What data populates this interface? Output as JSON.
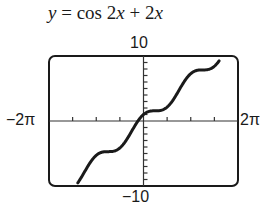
{
  "chart_data": {
    "type": "line",
    "title": "y = cos 2x + 2x",
    "function": "cos(2x) + 2x",
    "xlabel": "",
    "ylabel": "",
    "xlim": [
      -6.2832,
      6.2832
    ],
    "ylim": [
      -10,
      10
    ],
    "x_tick_labels": {
      "min": "−2π",
      "max": "2π"
    },
    "y_tick_labels": {
      "min": "−10",
      "max": "10"
    },
    "x_tick_spacing": "π/2",
    "y_tick_spacing": 1,
    "grid": false,
    "legend": null,
    "series": [
      {
        "name": "y = cos 2x + 2x",
        "x": [
          -4.37,
          -3.5,
          -3.0,
          -2.5,
          -2.0,
          -1.5,
          -1.0,
          -0.5,
          0,
          0.5,
          1.0,
          1.5,
          2.0,
          2.5,
          3.0,
          3.5,
          4.0,
          4.5,
          5.03
        ],
        "y": [
          -9.5,
          -7.75,
          -5.04,
          -5.28,
          -4.65,
          -3.99,
          -2.42,
          -0.46,
          1.0,
          1.54,
          1.58,
          2.01,
          3.35,
          5.28,
          6.96,
          7.75,
          7.85,
          8.09,
          9.25
        ]
      }
    ]
  },
  "labels": {
    "title_prefix": "y",
    "title_rest": " = cos 2",
    "title_x1": "x",
    "title_plus": " + 2",
    "title_x2": "x",
    "ymax": "10",
    "ymin": "−10",
    "xmin": "−2π",
    "xmax": "2π"
  }
}
